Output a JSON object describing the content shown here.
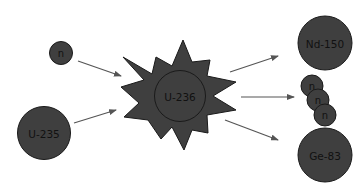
{
  "diagram": {
    "colors": {
      "particle_fill": "#3f3f3f",
      "particle_stroke": "#1a1a1a",
      "arrow": "#555555",
      "label": "#111111",
      "background": "#ffffff"
    },
    "reactants": {
      "neutron": {
        "label": "n"
      },
      "nucleus": {
        "label": "U-235"
      }
    },
    "intermediate": {
      "label": "U-236",
      "shape": "starburst"
    },
    "products": {
      "fragment_1": {
        "label": "Nd-150"
      },
      "neutrons": [
        {
          "label": "n"
        },
        {
          "label": "n"
        },
        {
          "label": "n"
        }
      ],
      "fragment_2": {
        "label": "Ge-83"
      }
    },
    "arrows": [
      {
        "from": "n",
        "to": "U-236"
      },
      {
        "from": "U-235",
        "to": "U-236"
      },
      {
        "from": "U-236",
        "to": "Nd-150"
      },
      {
        "from": "U-236",
        "to": "n"
      },
      {
        "from": "U-236",
        "to": "Ge-83"
      }
    ]
  }
}
